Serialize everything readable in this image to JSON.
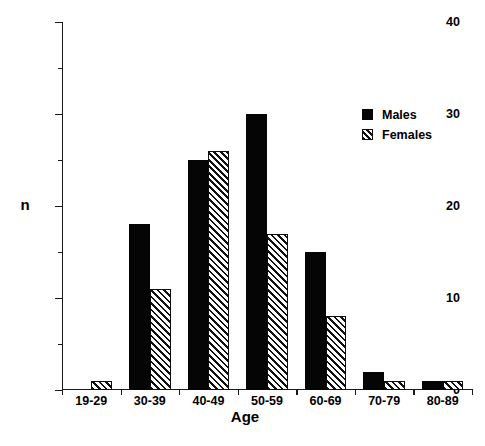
{
  "chart_data": {
    "type": "bar",
    "title": "",
    "subtitle": "",
    "xlabel": "Age",
    "ylabel": "n",
    "categories": [
      "19-29",
      "30-39",
      "40-49",
      "50-59",
      "60-69",
      "70-79",
      "80-89"
    ],
    "series": [
      {
        "name": "Males",
        "values": [
          0,
          18,
          25,
          30,
          15,
          2,
          1
        ],
        "fill": "solid-black",
        "color": "#050505"
      },
      {
        "name": "Females",
        "values": [
          1,
          11,
          26,
          17,
          8,
          1,
          1
        ],
        "fill": "diagonal-hatch",
        "color": "#111111"
      }
    ],
    "ylim": [
      0,
      40
    ],
    "ytick_major": [
      0,
      10,
      20,
      30,
      40
    ],
    "ytick_minor": [
      5,
      15,
      25,
      35
    ],
    "ytick_labels": [
      "0",
      "10",
      "20",
      "30",
      "40"
    ],
    "grid": false,
    "legend_position": "top-right",
    "legend_entries": [
      "Males",
      "Females"
    ]
  }
}
